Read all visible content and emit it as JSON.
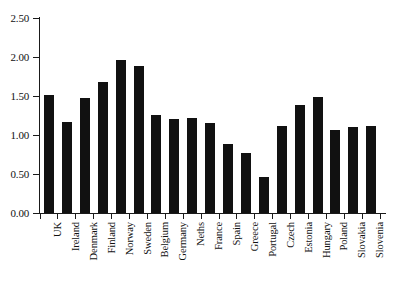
{
  "chart_data": {
    "type": "bar",
    "title": "",
    "subtitle": "",
    "xlabel": "",
    "ylabel": "",
    "ylim": [
      0.0,
      2.5
    ],
    "ytick_labels": [
      "0.00",
      "0.50",
      "1.00",
      "1.50",
      "2.00",
      "2.50"
    ],
    "ytick_values": [
      0.0,
      0.5,
      1.0,
      1.5,
      2.0,
      2.5
    ],
    "grid": false,
    "legend": null,
    "bar_color": "#111111",
    "axis_color": "#1a1a1a",
    "categories": [
      "UK",
      "Ireland",
      "Denmark",
      "Finland",
      "Norway",
      "Sweden",
      "Belgium",
      "Germany",
      "Neths",
      "France",
      "Spain",
      "Greece",
      "Portugal",
      "Czech",
      "Estonia",
      "Hungary",
      "Poland",
      "Slovakia",
      "Slovenia"
    ],
    "values": [
      1.51,
      1.17,
      1.47,
      1.68,
      1.96,
      1.88,
      1.26,
      1.21,
      1.22,
      1.15,
      0.88,
      0.77,
      0.46,
      1.11,
      1.38,
      1.49,
      1.07,
      1.1,
      1.12
    ]
  }
}
